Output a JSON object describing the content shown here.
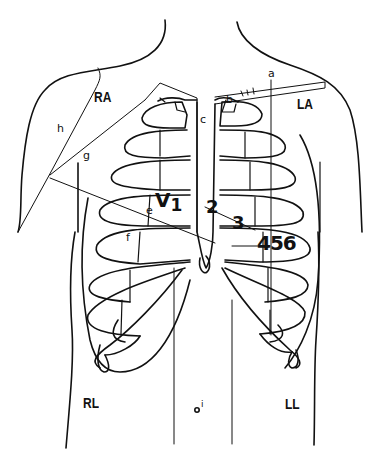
{
  "diagram": {
    "type": "anatomical line drawing — chest/torso with rib cage, ECG electrode placement",
    "limb_leads": [
      {
        "id": "RA",
        "label": "RA"
      },
      {
        "id": "LA",
        "label": "LA"
      },
      {
        "id": "RL",
        "label": "RL"
      },
      {
        "id": "LL",
        "label": "LL"
      }
    ],
    "precordial_leads": {
      "v1": "V",
      "v1_sub": "1",
      "v2": "2",
      "v3": "3",
      "v456": "456"
    },
    "reference_letters": {
      "a": "a",
      "b": "b",
      "c": "c",
      "d": "d",
      "e": "e",
      "f": "f",
      "g": "g",
      "h": "h",
      "i": "i"
    },
    "colors": {
      "line": "#111111",
      "background": "#ffffff"
    }
  }
}
